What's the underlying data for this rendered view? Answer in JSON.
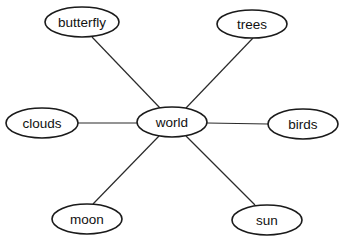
{
  "diagram": {
    "type": "concept-web",
    "center": {
      "id": "world",
      "label": "world",
      "cx": 172,
      "cy": 122,
      "rx": 35,
      "ry": 15
    },
    "nodes": [
      {
        "id": "butterfly",
        "label": "butterfly",
        "cx": 82,
        "cy": 22,
        "rx": 37,
        "ry": 15
      },
      {
        "id": "trees",
        "label": "trees",
        "cx": 252,
        "cy": 24,
        "rx": 35,
        "ry": 14
      },
      {
        "id": "clouds",
        "label": "clouds",
        "cx": 42,
        "cy": 123,
        "rx": 36,
        "ry": 15
      },
      {
        "id": "birds",
        "label": "birds",
        "cx": 303,
        "cy": 124,
        "rx": 35,
        "ry": 15
      },
      {
        "id": "moon",
        "label": "moon",
        "cx": 87,
        "cy": 219,
        "rx": 35,
        "ry": 15
      },
      {
        "id": "sun",
        "label": "sun",
        "cx": 267,
        "cy": 220,
        "rx": 35,
        "ry": 15
      }
    ],
    "edges": [
      {
        "from": "world",
        "to": "butterfly",
        "x1": 160,
        "y1": 108,
        "x2": 92,
        "y2": 37
      },
      {
        "from": "world",
        "to": "trees",
        "x1": 186,
        "y1": 108,
        "x2": 253,
        "y2": 38
      },
      {
        "from": "world",
        "to": "clouds",
        "x1": 137,
        "y1": 123,
        "x2": 78,
        "y2": 123
      },
      {
        "from": "world",
        "to": "birds",
        "x1": 207,
        "y1": 123,
        "x2": 268,
        "y2": 124
      },
      {
        "from": "world",
        "to": "moon",
        "x1": 159,
        "y1": 136,
        "x2": 93,
        "y2": 204
      },
      {
        "from": "world",
        "to": "sun",
        "x1": 186,
        "y1": 136,
        "x2": 255,
        "y2": 205
      }
    ],
    "colors": {
      "background": "#ffffff",
      "stroke": "#1a1a1a",
      "text": "#111111"
    }
  }
}
